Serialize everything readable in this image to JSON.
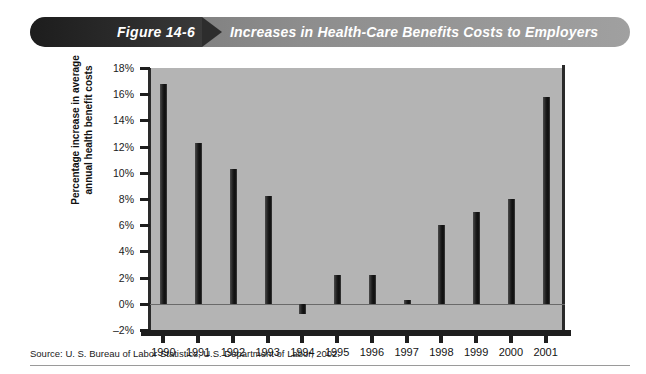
{
  "banner": {
    "figure_label": "Figure 14-6",
    "title": "Increases in Health-Care Benefits Costs to Employers",
    "dark_color": "#2a2a2a",
    "light_color": "#9a9a9a"
  },
  "footer": {
    "source": "Source: U. S. Bureau of Labor Statistics, U.S. Department of Labor, 2002."
  },
  "chart_data": {
    "type": "bar",
    "title": "Increases in Health-Care Benefits Costs to Employers",
    "xlabel": "",
    "ylabel": "Percentage increase in average annual health benefit costs",
    "ylabel_line1": "Percentage increase in average",
    "ylabel_line2": "annual health benefit costs",
    "categories": [
      "1990",
      "1991",
      "1992",
      "1993",
      "1994",
      "1995",
      "1996",
      "1997",
      "1998",
      "1999",
      "2000",
      "2001"
    ],
    "values": [
      16.8,
      12.3,
      10.3,
      8.2,
      -0.8,
      2.2,
      2.2,
      0.3,
      6.0,
      7.0,
      8.0,
      15.8
    ],
    "ylim": [
      -2,
      18
    ],
    "yticks": [
      18,
      16,
      14,
      12,
      10,
      8,
      6,
      4,
      2,
      0,
      -2
    ],
    "ytick_labels": [
      "18%",
      "16%",
      "14%",
      "12%",
      "10%",
      "8%",
      "6%",
      "4%",
      "2%",
      "0%",
      "–2%"
    ],
    "grid": false,
    "legend": false,
    "bar_color": "#1a1a1a",
    "plot_background": "#b4b4b4"
  }
}
